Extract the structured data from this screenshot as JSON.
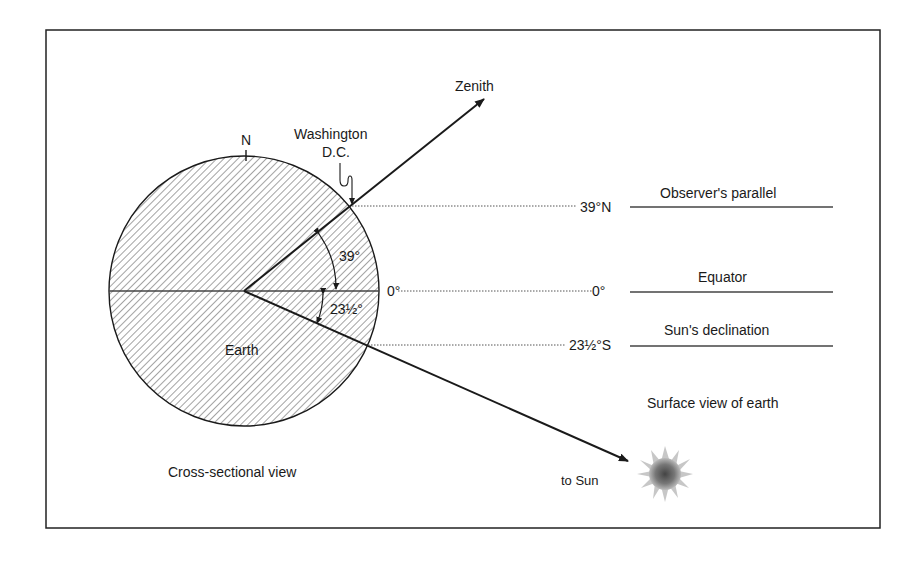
{
  "figure": {
    "colors": {
      "ink": "#1a1a1a",
      "frame": "#222222",
      "hatch": "#555555",
      "sun": "#555555",
      "background": "#ffffff"
    }
  },
  "cross_section": {
    "caption": "Cross-sectional view",
    "earth_label": "Earth",
    "north_label": "N",
    "location_label_line1": "Washington",
    "location_label_line2": "D.C.",
    "zenith_label": "Zenith",
    "observer_angle": "39°",
    "declination_angle": "23½°",
    "equator_mark": "0°"
  },
  "surface_view": {
    "caption": "Surface view of earth",
    "sun_label": "to Sun",
    "parallels": [
      {
        "latitude": "39°N",
        "name": "Observer's parallel"
      },
      {
        "latitude": "0°",
        "name": "Equator"
      },
      {
        "latitude": "23½°S",
        "name": "Sun's declination"
      }
    ]
  }
}
